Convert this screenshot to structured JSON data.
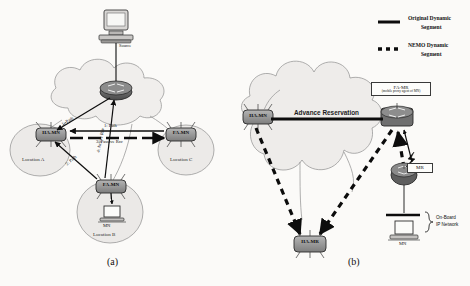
{
  "figure": {
    "background_color": "#fbfaf8",
    "captions": [
      {
        "id": "a",
        "text": "(a)"
      },
      {
        "id": "b",
        "text": "(b)"
      }
    ]
  },
  "legend": {
    "items": [
      {
        "swatch": "solid-line",
        "line_color": "#0c0c0c",
        "label_line1": "Original Dynamic",
        "label_line2": "Segment"
      },
      {
        "swatch": "dotted-line",
        "line_color": "#0c0c0c",
        "label_line1": "NEMO Dynamic",
        "label_line2": "Segment"
      }
    ]
  },
  "panel_a": {
    "caption": "(a)",
    "nodes": [
      {
        "id": "ha-mn",
        "label": "HA-MN",
        "type": "router"
      },
      {
        "id": "fa-mn-right",
        "label": "FA-MN",
        "type": "router"
      },
      {
        "id": "fa-mn-bottom",
        "label": "FA-MN",
        "type": "router"
      },
      {
        "id": "core-router",
        "label": "",
        "type": "router"
      }
    ],
    "devices": [
      {
        "id": "source-host",
        "label": "Source",
        "type": "workstation"
      },
      {
        "id": "mn-host",
        "label": "MN",
        "type": "laptop"
      }
    ],
    "clouds": [
      {
        "id": "location-a",
        "label": "Location A"
      },
      {
        "id": "location-b",
        "label": "Location B"
      },
      {
        "id": "location-c",
        "label": "Location C"
      },
      {
        "id": "core-cloud",
        "label": ""
      }
    ],
    "flows": [
      {
        "id": "flow-1",
        "label": "1: Path"
      },
      {
        "id": "flow-2",
        "label": "2: Path"
      },
      {
        "id": "flow-3",
        "label": "3: Passive Rsv"
      },
      {
        "id": "flow-4",
        "label": "4: Active Rsv"
      }
    ]
  },
  "panel_b": {
    "caption": "(b)",
    "nodes": [
      {
        "id": "ha-mn-b",
        "label": "HA-MN",
        "type": "router"
      },
      {
        "id": "fa-mr-b",
        "label": "",
        "type": "router"
      },
      {
        "id": "ha-mr-b",
        "label": "HA-MR",
        "type": "router"
      },
      {
        "id": "mr-b",
        "label": "MR",
        "type": "mobile-router"
      }
    ],
    "annotations": {
      "fa_mr_box_line1": "FA-MR",
      "fa_mr_box_line2": "(mobile proxy agent of MN)",
      "mr_box": "MR",
      "advance_reservation": "Advance Reservation",
      "on_board_line1": "On-Board",
      "on_board_line2": "IP Network",
      "mn_label": "MN"
    },
    "clouds": [
      {
        "id": "core-cloud-b",
        "label": ""
      }
    ],
    "devices": [
      {
        "id": "mn-host-b",
        "label": "MN",
        "type": "laptop"
      }
    ]
  }
}
